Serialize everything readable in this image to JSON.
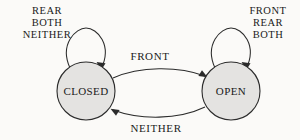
{
  "diagram": {
    "type": "finite-state-machine",
    "background_color": "#fbfaf8",
    "ink_color": "#2b2b2b",
    "node_fill_color": "#e4e3e1",
    "states": [
      {
        "id": "closed",
        "label": "CLOSED",
        "cx": 86,
        "cy": 91,
        "r": 29
      },
      {
        "id": "open",
        "label": "OPEN",
        "cx": 231,
        "cy": 91,
        "r": 29
      }
    ],
    "transitions": [
      {
        "id": "closed-to-open",
        "from": "closed",
        "to": "open",
        "label": "FRONT",
        "label_x": 150,
        "label_y": 60
      },
      {
        "id": "open-to-closed",
        "from": "open",
        "to": "closed",
        "label": "NEITHER",
        "label_x": 156,
        "label_y": 132
      }
    ],
    "self_loops": [
      {
        "id": "closed-self-loop",
        "state": "closed",
        "labels": [
          "REAR",
          "BOTH",
          "NEITHER"
        ],
        "label_x": 47,
        "label_y": 12
      },
      {
        "id": "open-self-loop",
        "state": "open",
        "labels": [
          "FRONT",
          "REAR",
          "BOTH"
        ],
        "label_x": 268,
        "label_y": 12
      }
    ]
  }
}
